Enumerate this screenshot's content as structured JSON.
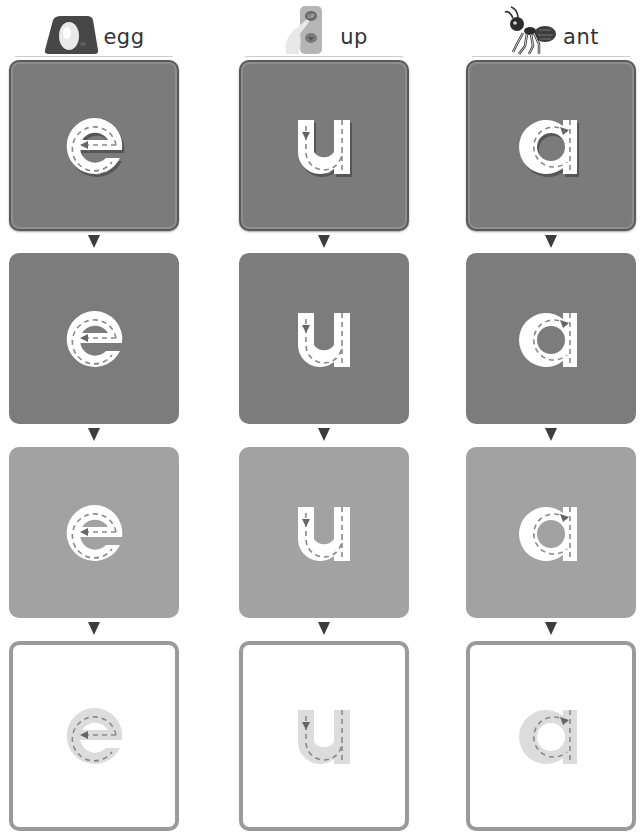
{
  "worksheet": {
    "columns": [
      {
        "letter": "e",
        "word": "egg",
        "picture_icon": "egg-in-nest-icon",
        "stroke_hint": "arrow-right-then-around",
        "rows": [
          {
            "style": "embossed-dark",
            "fill": "#7b7b7b",
            "letter_fill": "#ffffff"
          },
          {
            "style": "dark",
            "fill": "#7c7c7c",
            "letter_fill": "#ffffff"
          },
          {
            "style": "medium",
            "fill": "#a2a2a2",
            "letter_fill": "#ffffff"
          },
          {
            "style": "outline",
            "fill": "#ffffff",
            "border": "#9a9a9a",
            "letter_fill": "#dcdcdc"
          }
        ]
      },
      {
        "letter": "u",
        "word": "up",
        "picture_icon": "elevator-up-button-icon",
        "stroke_hint": "arrow-down-then-around",
        "rows": [
          {
            "style": "embossed-dark",
            "fill": "#7b7b7b",
            "letter_fill": "#ffffff"
          },
          {
            "style": "dark",
            "fill": "#7c7c7c",
            "letter_fill": "#ffffff"
          },
          {
            "style": "medium",
            "fill": "#a2a2a2",
            "letter_fill": "#ffffff"
          },
          {
            "style": "outline",
            "fill": "#ffffff",
            "border": "#9a9a9a",
            "letter_fill": "#dcdcdc"
          }
        ]
      },
      {
        "letter": "a",
        "word": "ant",
        "picture_icon": "ant-icon",
        "stroke_hint": "arrow-left-around",
        "rows": [
          {
            "style": "embossed-dark",
            "fill": "#7b7b7b",
            "letter_fill": "#ffffff"
          },
          {
            "style": "dark",
            "fill": "#7c7c7c",
            "letter_fill": "#ffffff"
          },
          {
            "style": "medium",
            "fill": "#a2a2a2",
            "letter_fill": "#ffffff"
          },
          {
            "style": "outline",
            "fill": "#ffffff",
            "border": "#9a9a9a",
            "letter_fill": "#dcdcdc"
          }
        ]
      }
    ],
    "arrow_color": "#3d3d3d"
  }
}
